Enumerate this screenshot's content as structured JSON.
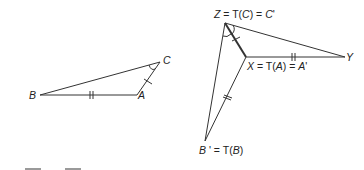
{
  "diagram": {
    "type": "geometric-transformation",
    "stroke_color": "#333333",
    "original_triangle": {
      "vertices": {
        "B": {
          "label": "B",
          "x": 40,
          "y": 95
        },
        "A": {
          "label": "A",
          "x": 137,
          "y": 95
        },
        "C": {
          "label": "C",
          "x": 160,
          "y": 62
        }
      },
      "sides": [
        {
          "from": "B",
          "to": "A",
          "tick_marks": 2
        },
        {
          "from": "A",
          "to": "C",
          "tick_marks": 1
        },
        {
          "from": "C",
          "to": "B",
          "tick_marks": 0
        }
      ],
      "angle_marks": [
        {
          "vertex": "C",
          "arcs": 1
        }
      ]
    },
    "image_figure": {
      "vertices": {
        "Z": {
          "label_parts": [
            "Z",
            " = T(",
            "C",
            ") = ",
            "C",
            "'"
          ],
          "x": 225,
          "y": 23
        },
        "X": {
          "label_parts": [
            "X",
            " = T(",
            "A",
            ") = ",
            "A",
            "'"
          ],
          "x": 246,
          "y": 57
        },
        "Y": {
          "label": "Y",
          "x": 345,
          "y": 57
        },
        "Bp": {
          "label_parts": [
            "B",
            " ' = T(",
            "B",
            ")"
          ],
          "x": 205,
          "y": 141
        }
      },
      "segments": [
        {
          "from": "Z",
          "to": "Y",
          "tick_marks": 0
        },
        {
          "from": "Z",
          "to": "X",
          "tick_marks": 1,
          "bold": true
        },
        {
          "from": "X",
          "to": "Y",
          "tick_marks": 2
        },
        {
          "from": "X",
          "to": "Bp",
          "tick_marks": 2
        },
        {
          "from": "Z",
          "to": "Bp",
          "tick_marks": 0
        }
      ],
      "angle_marks": [
        {
          "vertex": "Z",
          "between": [
            "Y",
            "X"
          ],
          "arcs": 1
        },
        {
          "vertex": "Z",
          "between": [
            "X",
            "Bp"
          ],
          "arcs": 1
        }
      ]
    }
  }
}
